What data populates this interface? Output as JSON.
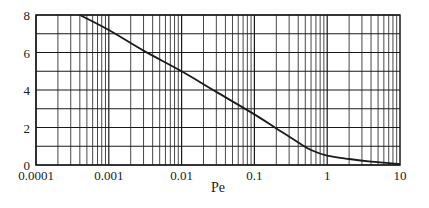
{
  "chart_data": {
    "type": "line",
    "title": "",
    "xlabel": "Pe",
    "ylabel": "",
    "xscale": "log",
    "xlim": [
      0.0001,
      10
    ],
    "ylim": [
      0,
      8
    ],
    "grid": true,
    "x_ticks": [
      0.0001,
      0.001,
      0.01,
      0.1,
      1,
      10
    ],
    "x_tick_labels": [
      "0.0001",
      "0.001",
      "0.01",
      "0.1",
      "1",
      "10"
    ],
    "y_ticks": [
      0,
      2,
      4,
      6,
      8
    ],
    "y_tick_labels": [
      "0",
      "2",
      "4",
      "6",
      "8"
    ],
    "y_minor_ticks": [
      1,
      3,
      5,
      7
    ],
    "series": [
      {
        "name": "curve",
        "color": "#1a1a1a",
        "x": [
          0.0004,
          0.001,
          0.003,
          0.01,
          0.03,
          0.1,
          0.2,
          0.4,
          0.6,
          1,
          2,
          4,
          10
        ],
        "y": [
          8.0,
          7.2,
          6.1,
          5.0,
          3.9,
          2.7,
          1.95,
          1.2,
          0.8,
          0.5,
          0.32,
          0.18,
          0.05
        ]
      }
    ]
  }
}
